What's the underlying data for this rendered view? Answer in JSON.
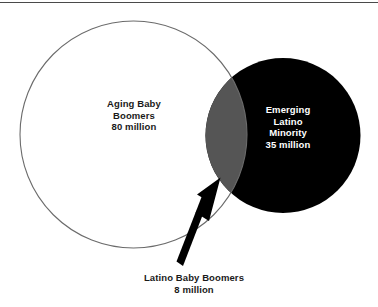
{
  "figure": {
    "type": "venn-diagram",
    "title_rule": "horizontal-divider",
    "background_color": "#ffffff",
    "top_rule": {
      "name": "top-divider-line",
      "color": "#4a4a4a",
      "y": 2,
      "thickness": 1
    },
    "sets": [
      {
        "id": "aging-baby-boomers",
        "name": "left-circle",
        "style": "outline",
        "stroke_color": "#6b6b6b",
        "fill_color": "#ffffff",
        "center_x": 133.5,
        "center_y": 134.5,
        "radius": 113.5,
        "label_lines": [
          "Aging Baby",
          "Boomers",
          "80 million"
        ],
        "label_color": "#1a1a1a",
        "value": 80,
        "value_unit": "million"
      },
      {
        "id": "emerging-latino-minority",
        "name": "right-circle",
        "style": "filled",
        "stroke_color": "#000000",
        "fill_color": "#000000",
        "center_x": 283,
        "center_y": 135.5,
        "radius": 77.5,
        "label_lines": [
          "Emerging",
          "Latino",
          "Minority",
          "35 million"
        ],
        "label_color": "#ffffff",
        "value": 35,
        "value_unit": "million"
      }
    ],
    "intersection": {
      "id": "latino-baby-boomers",
      "name": "overlap-lens",
      "fill_color": "#555555",
      "label_lines": [
        "Latino Baby Boomers",
        "8 million"
      ],
      "label_color": "#1a1a1a",
      "value": 8,
      "value_unit": "million"
    },
    "annotation_arrow": {
      "name": "callout-arrow",
      "color": "#000000",
      "from_x": 183,
      "from_y": 265,
      "to_x": 220,
      "to_y": 178
    }
  },
  "labels": {
    "left": {
      "line1": "Aging Baby",
      "line2": "Boomers",
      "line3": "80 million"
    },
    "right": {
      "line1": "Emerging",
      "line2": "Latino",
      "line3": "Minority",
      "line4": "35 million"
    },
    "bottom": {
      "line1": "Latino Baby Boomers",
      "line2": "8 million"
    }
  }
}
